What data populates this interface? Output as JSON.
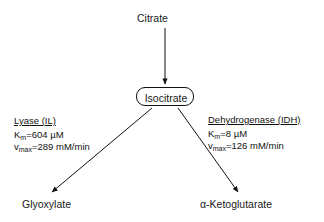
{
  "diagram": {
    "type": "pathway-branch",
    "substrate_top": "Citrate",
    "intermediate": "Isocitrate",
    "branches": [
      {
        "side": "left",
        "enzyme_name": "Lyase (IL)",
        "km_label": "K",
        "km_sub": "m",
        "km_value": "=604 µM",
        "km_full": "Kₘ=604 µM",
        "vmax_label": "v",
        "vmax_sub": "max",
        "vmax_value": "=289 mM/min",
        "vmax_full": "vₘₐₓ=289 mM/min",
        "product": "Glyoxylate"
      },
      {
        "side": "right",
        "enzyme_name": "Dehydrogenase (IDH)",
        "km_label": "K",
        "km_sub": "m",
        "km_value": "=8 µM",
        "km_full": "Kₘ=8 µM",
        "vmax_label": "v",
        "vmax_sub": "max",
        "vmax_value": "=126 mM/min",
        "vmax_full": "vₘₐₓ=126 mM/min",
        "product": "α-Ketoglutarate"
      }
    ],
    "colors": {
      "background": "#ffffff",
      "stroke": "#111111",
      "text": "#1a1a1a"
    }
  }
}
